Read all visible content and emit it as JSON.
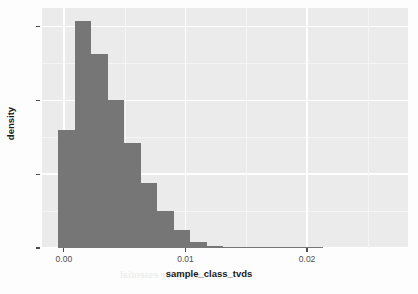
{
  "chart_data": {
    "type": "bar",
    "title": "",
    "subtitle": "",
    "xlabel": "sample_class_tvds",
    "ylabel": "density",
    "grid": true,
    "legend": "none",
    "xlim": [
      -0.0018,
      0.0283
    ],
    "ylim": [
      0,
      130
    ],
    "x_ticks": [
      0.0,
      0.01,
      0.02
    ],
    "x_tick_labels": [
      "0.00",
      "0.01",
      "0.02"
    ],
    "y_ticks": [
      0,
      40,
      80,
      120
    ],
    "y_tick_labels": [
      "0",
      "40",
      "80",
      "120"
    ],
    "bin_width": 0.00136,
    "bar_color": "#767676",
    "panel_color": "#ebebeb",
    "gridline_color": "#ffffff",
    "x": [
      0.0002,
      0.00156,
      0.00292,
      0.00428,
      0.00564,
      0.007,
      0.00836,
      0.00972,
      0.01108,
      0.01244,
      0.0138,
      0.01516,
      0.01652,
      0.01788,
      0.01924,
      0.0206
    ],
    "bin_starts": [
      -0.00048,
      0.00088,
      0.00224,
      0.0036,
      0.00496,
      0.00632,
      0.00768,
      0.00904,
      0.0104,
      0.01176,
      0.01312,
      0.01448,
      0.01584,
      0.0172,
      0.01856,
      0.01992
    ],
    "values": [
      64,
      123,
      105,
      80,
      57,
      35,
      20,
      10,
      3,
      1.2,
      0.6,
      0.4,
      0.3,
      0.2,
      0.15,
      0.1
    ],
    "categories": [
      "-0.0005",
      "0.0009",
      "0.0022",
      "0.0036",
      "0.0050",
      "0.0063",
      "0.0077",
      "0.0090",
      "0.0104",
      "0.0118",
      "0.0131",
      "0.0145",
      "0.0158",
      "0.0172",
      "0.0186",
      "0.0199"
    ]
  },
  "axes": {
    "x_title": "sample_class_tvds",
    "y_title": "density"
  },
  "bleed_text": {
    "line1": "uniformity Levels",
    "line2": "oversampling used to",
    "line3": "sampling, we randomly",
    "line4": "ampling ratio Corollary",
    "line5": "each value",
    "line6": "of the top",
    "line7": "the vast majority",
    "line8": "using the essential"
  }
}
